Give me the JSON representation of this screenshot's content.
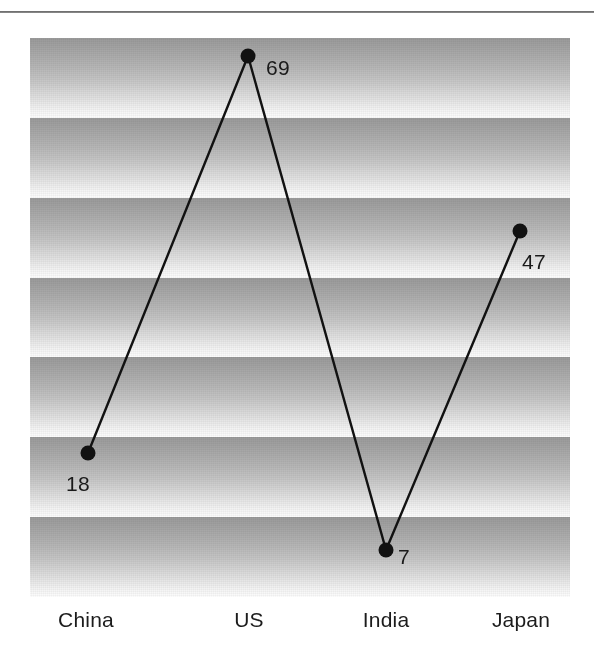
{
  "figure": {
    "background_color": "#ffffff",
    "top_rule_color": "#5b5b5b",
    "plot": {
      "left": 30,
      "top": 38,
      "width": 540,
      "height": 559,
      "band_count": 7,
      "band_top_color": "#9a9a9a",
      "band_bottom_color": "#fdfdfd"
    }
  },
  "chart_data": {
    "type": "line",
    "title": "",
    "subtitle": "",
    "xlabel": "",
    "ylabel": "",
    "grid": true,
    "grid_style": "horizontal gradient bands",
    "legend": false,
    "legend_position": "none",
    "marker": "filled-circle",
    "line_color": "#111111",
    "marker_color": "#111111",
    "categories": [
      "China",
      "US",
      "India",
      "Japan"
    ],
    "values": [
      18,
      69,
      7,
      47
    ],
    "value_labels": [
      "18",
      "69",
      "7",
      "47"
    ],
    "ylim": [
      0,
      76
    ],
    "points": [
      {
        "category": "China",
        "value": 18,
        "label": "18",
        "px": 88,
        "py": 453,
        "label_x": 66,
        "label_y": 473
      },
      {
        "category": "US",
        "value": 69,
        "label": "69",
        "px": 248,
        "py": 56,
        "label_x": 266,
        "label_y": 57
      },
      {
        "category": "India",
        "value": 7,
        "label": "7",
        "px": 386,
        "py": 550,
        "label_x": 398,
        "label_y": 546
      },
      {
        "category": "Japan",
        "value": 47,
        "label": "47",
        "px": 520,
        "py": 231,
        "label_x": 522,
        "label_y": 251
      }
    ]
  },
  "axis": {
    "categories": [
      {
        "label": "China",
        "x": 86
      },
      {
        "label": "US",
        "x": 249
      },
      {
        "label": "India",
        "x": 386
      },
      {
        "label": "Japan",
        "x": 521
      }
    ]
  }
}
